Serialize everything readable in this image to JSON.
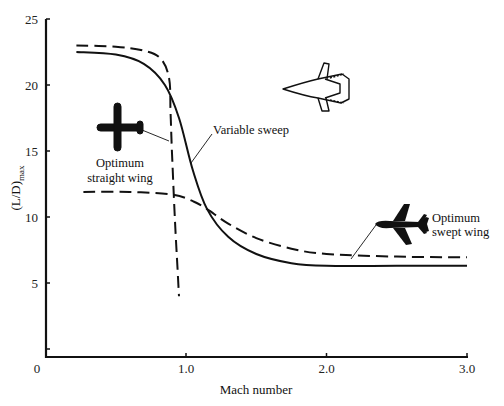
{
  "chart_data": {
    "type": "line",
    "title": "",
    "xlabel": "Mach number",
    "ylabel": "(L/D)max",
    "ylabel_main": "(L/D)",
    "ylabel_sub": "max",
    "xlim": [
      0,
      3.0
    ],
    "ylim": [
      0,
      25
    ],
    "grid": false,
    "legend": "none (inline annotations)",
    "x_ticks": [
      "0",
      "1.0",
      "2.0",
      "3.0"
    ],
    "x_tick_values": [
      0,
      1.0,
      2.0,
      3.0
    ],
    "y_ticks": [
      "0",
      "5",
      "10",
      "15",
      "20",
      "25"
    ],
    "y_tick_values": [
      0,
      5,
      10,
      15,
      20,
      25
    ],
    "series": [
      {
        "name": "Optimum straight wing",
        "style": "dashed",
        "points": [
          [
            0.22,
            23.0
          ],
          [
            0.5,
            22.9
          ],
          [
            0.7,
            22.6
          ],
          [
            0.82,
            22.0
          ],
          [
            0.88,
            20.5
          ],
          [
            0.89,
            18
          ],
          [
            0.9,
            15
          ],
          [
            0.92,
            10
          ],
          [
            0.94,
            6
          ],
          [
            0.95,
            4.0
          ]
        ]
      },
      {
        "name": "Variable sweep",
        "style": "solid",
        "points": [
          [
            0.22,
            22.5
          ],
          [
            0.5,
            22.3
          ],
          [
            0.7,
            21.6
          ],
          [
            0.85,
            20
          ],
          [
            0.95,
            17.5
          ],
          [
            1.05,
            13.5
          ],
          [
            1.15,
            10.6
          ],
          [
            1.3,
            8.5
          ],
          [
            1.5,
            7.2
          ],
          [
            1.75,
            6.5
          ],
          [
            2.0,
            6.3
          ],
          [
            2.5,
            6.3
          ],
          [
            3.0,
            6.3
          ]
        ]
      },
      {
        "name": "Optimum swept wing",
        "style": "dashed",
        "points": [
          [
            0.27,
            11.9
          ],
          [
            0.6,
            11.9
          ],
          [
            0.9,
            11.7
          ],
          [
            1.05,
            11.2
          ],
          [
            1.15,
            10.6
          ],
          [
            1.3,
            9.5
          ],
          [
            1.5,
            8.4
          ],
          [
            1.75,
            7.6
          ],
          [
            2.0,
            7.2
          ],
          [
            2.5,
            7.0
          ],
          [
            3.0,
            6.95
          ]
        ]
      }
    ],
    "annotations": [
      {
        "text": "Variable sweep",
        "points_to": "Variable sweep curve at ~Mach 1.05"
      },
      {
        "text_lines": [
          "Optimum",
          "straight wing"
        ],
        "icon": "straight-wing-aircraft"
      },
      {
        "text_lines": [
          "Optimum",
          "swept wing"
        ],
        "icon": "swept-wing-aircraft"
      },
      {
        "icon": "variable-sweep-aircraft",
        "position": "upper right"
      }
    ]
  },
  "labels": {
    "variable_sweep": "Variable sweep",
    "straight_line1": "Optimum",
    "straight_line2": "straight wing",
    "swept_line1": "Optimum",
    "swept_line2": "swept wing"
  }
}
